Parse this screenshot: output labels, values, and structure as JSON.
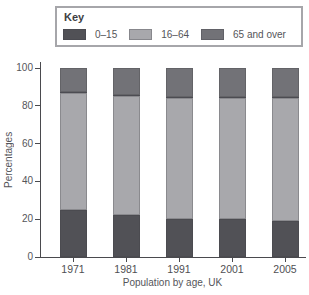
{
  "key": {
    "title": "Key"
  },
  "axes": {
    "y_label": "Percentages",
    "y_ticks": [
      0,
      20,
      40,
      60,
      80,
      100
    ],
    "x_caption": "Population by age, UK"
  },
  "chart_data": {
    "type": "bar",
    "stacked": true,
    "title": "",
    "xlabel": "Population by age, UK",
    "ylabel": "Percentages",
    "ylim": [
      0,
      100
    ],
    "grid": false,
    "legend_position": "top-box",
    "categories": [
      "1971",
      "1981",
      "1991",
      "2001",
      "2005"
    ],
    "series": [
      {
        "name": "0–15",
        "color": "#515156",
        "values": [
          25,
          22,
          20,
          20,
          19
        ]
      },
      {
        "name": "16–64",
        "color": "#a8a8ac",
        "values": [
          62,
          63,
          64,
          64,
          65
        ]
      },
      {
        "name": "65 and over",
        "color": "#727277",
        "values": [
          13,
          15,
          16,
          16,
          16
        ]
      }
    ]
  },
  "colors": {
    "axis": "#4a4a4e",
    "text": "#4f4f53",
    "key_border": "#a6a6aa",
    "background": "#ffffff"
  }
}
